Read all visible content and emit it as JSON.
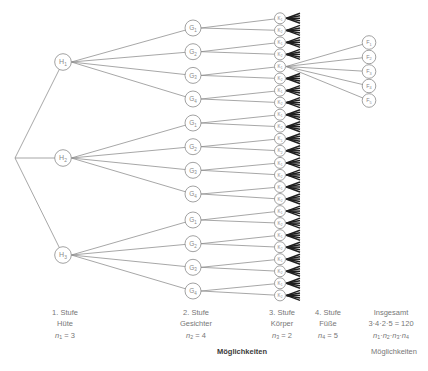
{
  "figure": {
    "kind": "combinatorics-tree-diagram",
    "background": "#ffffff",
    "edge_color": "#8a8a8a",
    "node_fill": "#ffffff",
    "node_stroke": "#8a8a8a",
    "label_color": "#8a8a8a",
    "caption_color": "#777777",
    "caption_bold_color": "#3a3a3a",
    "fan_color": "#1f1f1f"
  },
  "tree": {
    "root": {
      "x": 15,
      "y": 158
    },
    "expanded_k": 4,
    "fan": {
      "offsets": [
        -5,
        -2.5,
        0,
        2.5,
        5
      ],
      "length": 13.5,
      "branch_count": 5
    },
    "stages": [
      {
        "key": "H",
        "letter": "H",
        "x": 63,
        "r": 8.3,
        "font": 7,
        "label_dy": 2.4,
        "nodes": [
          {
            "sub": "1",
            "y": 62
          },
          {
            "sub": "2",
            "y": 158
          },
          {
            "sub": "3",
            "y": 255
          }
        ]
      },
      {
        "key": "G",
        "letter": "G",
        "x": 193,
        "r": 8,
        "font": 6.5,
        "label_dy": 2.2,
        "nodes": [
          {
            "sub": "1",
            "y": 28
          },
          {
            "sub": "2",
            "y": 51.7
          },
          {
            "sub": "3",
            "y": 75.4
          },
          {
            "sub": "4",
            "y": 99
          },
          {
            "sub": "1",
            "y": 123
          },
          {
            "sub": "2",
            "y": 146.7
          },
          {
            "sub": "3",
            "y": 170.3
          },
          {
            "sub": "4",
            "y": 194
          },
          {
            "sub": "1",
            "y": 220
          },
          {
            "sub": "2",
            "y": 243.7
          },
          {
            "sub": "3",
            "y": 267.3
          },
          {
            "sub": "4",
            "y": 291
          }
        ]
      },
      {
        "key": "K",
        "letter": "K",
        "x": 280,
        "r": 5.5,
        "font": 4.6,
        "label_dy": 1.6,
        "nodes": [
          {
            "sub": "1",
            "y": 18.3
          },
          {
            "sub": "2",
            "y": 30.4
          },
          {
            "sub": "1",
            "y": 42.4
          },
          {
            "sub": "2",
            "y": 54.4
          },
          {
            "sub": "1",
            "y": 66.5
          },
          {
            "sub": "2",
            "y": 78.5
          },
          {
            "sub": "1",
            "y": 90.6
          },
          {
            "sub": "2",
            "y": 102.6
          },
          {
            "sub": "1",
            "y": 114.7
          },
          {
            "sub": "2",
            "y": 126.7
          },
          {
            "sub": "1",
            "y": 138.8
          },
          {
            "sub": "2",
            "y": 150.8
          },
          {
            "sub": "1",
            "y": 162.9
          },
          {
            "sub": "2",
            "y": 174.9
          },
          {
            "sub": "1",
            "y": 187
          },
          {
            "sub": "2",
            "y": 199
          },
          {
            "sub": "1",
            "y": 211.1
          },
          {
            "sub": "2",
            "y": 223.1
          },
          {
            "sub": "1",
            "y": 235.2
          },
          {
            "sub": "2",
            "y": 247.2
          },
          {
            "sub": "1",
            "y": 259.2
          },
          {
            "sub": "2",
            "y": 271.3
          },
          {
            "sub": "1",
            "y": 283.3
          },
          {
            "sub": "2",
            "y": 295.4
          }
        ]
      },
      {
        "key": "F",
        "letter": "F",
        "x": 369,
        "r": 6.8,
        "font": 5.5,
        "label_dy": 1.9,
        "nodes": [
          {
            "sub": "1",
            "y": 42.5
          },
          {
            "sub": "2",
            "y": 57
          },
          {
            "sub": "3",
            "y": 71.5
          },
          {
            "sub": "4",
            "y": 86
          },
          {
            "sub": "5",
            "y": 100.5
          }
        ]
      }
    ],
    "children_per_stage": {
      "H": 3,
      "G": 4,
      "K": 2,
      "F": 5
    }
  },
  "captions": {
    "line_y": [
      315,
      326,
      337.5
    ],
    "caption_y": 354,
    "stages": [
      {
        "x": 65,
        "lines": [
          "1. Stufe",
          "Hüte"
        ],
        "formula": [
          {
            "t": "n",
            "i": true
          },
          {
            "t": "1",
            "sub": true
          },
          {
            "t": " = 3"
          }
        ]
      },
      {
        "x": 196,
        "lines": [
          "2. Stufe",
          "Gesichter"
        ],
        "formula": [
          {
            "t": "n",
            "i": true
          },
          {
            "t": "2",
            "sub": true
          },
          {
            "t": " = 4"
          }
        ]
      },
      {
        "x": 282,
        "lines": [
          "3. Stufe",
          "Körper"
        ],
        "formula": [
          {
            "t": "n",
            "i": true
          },
          {
            "t": "3",
            "sub": true
          },
          {
            "t": " = 2"
          }
        ]
      },
      {
        "x": 328,
        "lines": [
          "4. Stufe",
          "Füße"
        ],
        "formula": [
          {
            "t": "n",
            "i": true
          },
          {
            "t": "4",
            "sub": true
          },
          {
            "t": " = 5"
          }
        ]
      },
      {
        "x": 391,
        "lines": [
          "Insgesamt",
          "3·4·2·5 = 120"
        ],
        "formula": [
          {
            "t": "n",
            "i": true
          },
          {
            "t": "1",
            "sub": true
          },
          {
            "t": "·"
          },
          {
            "t": "n",
            "i": true
          },
          {
            "t": "2",
            "sub": true
          },
          {
            "t": "·"
          },
          {
            "t": "n",
            "i": true
          },
          {
            "t": "3",
            "sub": true
          },
          {
            "t": "·"
          },
          {
            "t": "n",
            "i": true
          },
          {
            "t": "4",
            "sub": true
          }
        ]
      }
    ],
    "bold_label": "Möglichkeiten",
    "right_label": "Möglichkeiten"
  }
}
